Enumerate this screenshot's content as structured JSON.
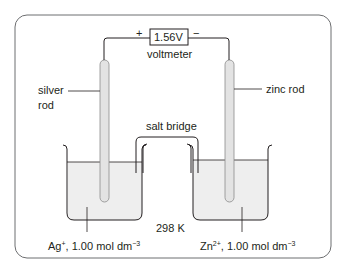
{
  "diagram": {
    "voltmeter": {
      "reading": "1.56V",
      "label": "voltmeter",
      "positive": "+",
      "negative": "−"
    },
    "left_electrode": {
      "label_line1": "silver",
      "label_line2": "rod"
    },
    "right_electrode": {
      "label": "zinc rod"
    },
    "salt_bridge": {
      "label": "salt bridge"
    },
    "temperature": "298 K",
    "left_solution": {
      "ion": "Ag",
      "charge": "+",
      "conc": ", 1.00 mol dm",
      "exp": "−3"
    },
    "right_solution": {
      "ion": "Zn",
      "charge": "2+",
      "conc": ", 1.00 mol dm",
      "exp": "−3"
    },
    "colors": {
      "line": "#231f20",
      "liquid": "#eeeeee",
      "rod": "#e3e3e3",
      "frame": "#6d6e70"
    }
  }
}
